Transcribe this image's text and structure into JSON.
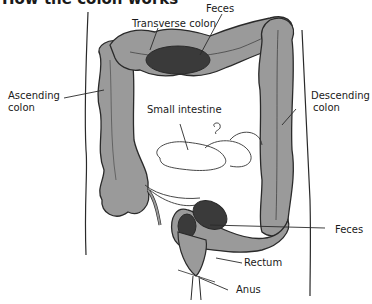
{
  "title": "How the colon works",
  "labels": {
    "feces_top": "Feces",
    "transverse_colon": "Transverse colon",
    "ascending_colon_1": "Ascending",
    "ascending_colon_2": "colon",
    "descending_colon_1": "Descending",
    "descending_colon_2": "colon",
    "small_intestine": "Small intestine",
    "feces_bottom": "Feces",
    "rectum": "Rectum",
    "anus": "Anus"
  },
  "colors": {
    "colon_fill": "#9a9a9a",
    "feces_fill": "#3a3a3a",
    "outline": "#2a2a2a",
    "background": "#ffffff"
  }
}
